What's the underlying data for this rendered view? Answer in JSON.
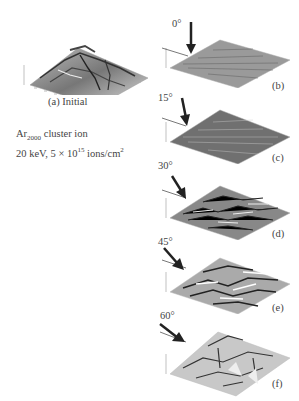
{
  "figure": {
    "panel_a": {
      "label": "(a) Initial"
    },
    "conditions": {
      "ion_base": "Ar",
      "ion_sub": "2000",
      "ion_suffix": " cluster ion",
      "energy_text": "20 keV, 5 × 10",
      "dose_exp": "15",
      "dose_unit": " ions/cm",
      "unit_exp": "2"
    },
    "panels": [
      {
        "id": "b",
        "angle": "0°",
        "label": "(b)"
      },
      {
        "id": "c",
        "angle": "15°",
        "label": "(c)"
      },
      {
        "id": "d",
        "angle": "30°",
        "label": "(d)"
      },
      {
        "id": "e",
        "angle": "45°",
        "label": "(e)"
      },
      {
        "id": "f",
        "angle": "60°",
        "label": "(f)"
      }
    ]
  },
  "colors": {
    "surface_light": "#cfcfcf",
    "surface_dark": "#555555",
    "arrow": "#222222"
  }
}
